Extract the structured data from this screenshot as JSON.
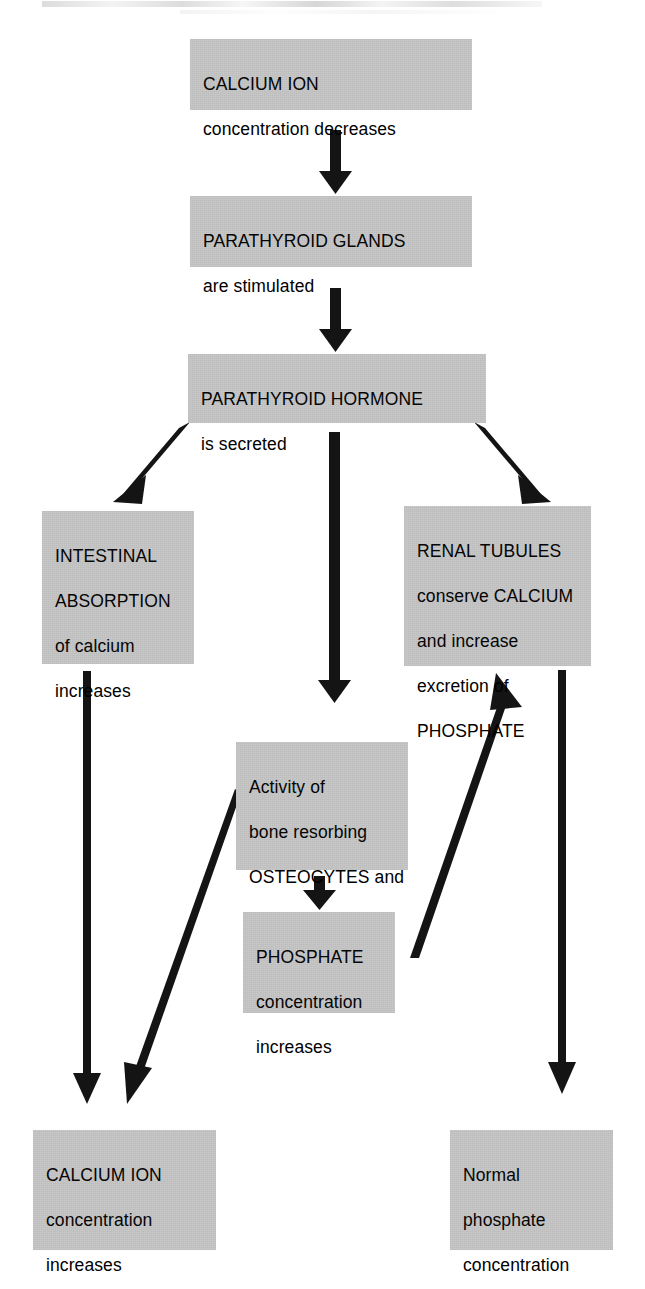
{
  "diagram": {
    "background_color": "#ffffff",
    "box_fill_color": "#c6c6c6",
    "text_color": "#000000",
    "arrow_color": "#111111",
    "nodes": [
      {
        "id": "calcium-decrease",
        "lines": [
          "CALCIUM ION",
          "concentration decreases"
        ]
      },
      {
        "id": "parathyroid-glands",
        "lines": [
          "PARATHYROID GLANDS",
          "are stimulated"
        ]
      },
      {
        "id": "pth-secreted",
        "lines": [
          "PARATHYROID HORMONE",
          "is secreted"
        ]
      },
      {
        "id": "intestinal",
        "lines": [
          "INTESTINAL",
          "ABSORPTION",
          "of calcium",
          "increases"
        ]
      },
      {
        "id": "renal-tubules",
        "lines": [
          "RENAL TUBULES",
          "conserve CALCIUM",
          "and increase",
          "excretion of",
          "PHOSPHATE"
        ]
      },
      {
        "id": "osteocytes",
        "lines": [
          "Activity of",
          "bone resorbing",
          "OSTEOCYTES and",
          "OSTEOCLASTS",
          "increases"
        ]
      },
      {
        "id": "phosphate-increase",
        "lines": [
          "PHOSPHATE",
          "concentration",
          "increases"
        ]
      },
      {
        "id": "calcium-increase",
        "lines": [
          "CALCIUM ION",
          "concentration",
          "increases"
        ]
      },
      {
        "id": "normal-phosphate",
        "lines": [
          "Normal",
          "phosphate",
          "concentration",
          "is maintained"
        ]
      }
    ],
    "connections": [
      {
        "from": "calcium-decrease",
        "to": "parathyroid-glands",
        "style": "thick-vertical"
      },
      {
        "from": "parathyroid-glands",
        "to": "pth-secreted",
        "style": "thick-vertical"
      },
      {
        "from": "pth-secreted",
        "to": "intestinal",
        "style": "thick-diagonal-down-left"
      },
      {
        "from": "pth-secreted",
        "to": "osteocytes",
        "style": "thick-vertical"
      },
      {
        "from": "pth-secreted",
        "to": "renal-tubules",
        "style": "thick-diagonal-down-right"
      },
      {
        "from": "intestinal",
        "to": "calcium-increase",
        "style": "thin-vertical"
      },
      {
        "from": "osteocytes",
        "to": "phosphate-increase",
        "style": "thick-vertical"
      },
      {
        "from": "osteocytes",
        "to": "calcium-increase",
        "style": "thin-diagonal-down-left"
      },
      {
        "from": "phosphate-increase",
        "to": "renal-tubules",
        "style": "thin-diagonal-up-right"
      },
      {
        "from": "renal-tubules",
        "to": "normal-phosphate",
        "style": "thin-vertical"
      }
    ]
  }
}
